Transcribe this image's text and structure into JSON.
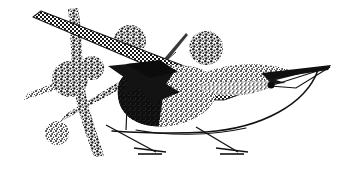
{
  "artwork": {
    "title": "Abstract halftone bird on branch",
    "medium": "high-contrast halftone / dither print illustration",
    "width": 347,
    "height": 171,
    "background_color": "#ffffff",
    "ink_color": "#1a1a1a",
    "description": "Stylized bird composed of overlapping geometric shapes filled with checkerboard, coarse dot, and solid black halftone textures, perched with two thin legs over a long sweeping curve, surrounded by dotted circular blobs and a dotted vertical branch."
  },
  "palette": {
    "solid_black": "#141414",
    "dark_gray": "#4a4a4a",
    "mid_gray": "#777777",
    "light_gray": "#a8a8a8",
    "paper_white": "#ffffff"
  },
  "elements": {
    "checkered_band": {
      "name": "checkered diagonal band",
      "texture": "checkerboard",
      "tone": "50% black",
      "note": "runs from upper-left corner down-right, widening into the wing"
    },
    "wing": {
      "name": "checkered wing",
      "texture": "checkerboard",
      "tone": "50% black"
    },
    "dark_wedge": {
      "name": "solid black wedge",
      "texture": "solid",
      "tone": "100% black"
    },
    "breast": {
      "name": "breast dome",
      "texture": "coarse dots",
      "tone": "60% black"
    },
    "belly": {
      "name": "belly dome",
      "texture": "fine dots",
      "tone": "45% black"
    },
    "head": {
      "name": "lens shaped head",
      "texture": "fine dots",
      "tone": "40% black"
    },
    "eye": {
      "name": "eye",
      "texture": "solid",
      "tone": "100% black"
    },
    "beak": {
      "name": "pointed beak",
      "texture": "solid",
      "tone": "100% black"
    },
    "legs": {
      "name": "thin legs with flat feet",
      "count": 2,
      "texture": "line",
      "tone": "100% black"
    },
    "belly_arc": {
      "name": "long sweeping curve",
      "texture": "line",
      "tone": "100% black"
    },
    "crest_line": {
      "name": "thin tapered crest stroke",
      "texture": "line",
      "tone": "80% black"
    },
    "branch_vertical": {
      "name": "dotted vertical branch",
      "texture": "coarse dots",
      "tone": "50% black"
    },
    "branch_diagonal": {
      "name": "dotted diagonal branch",
      "texture": "coarse dots",
      "tone": "50% black"
    }
  },
  "blobs": [
    {
      "name": "blob-upper-left",
      "cx": 130,
      "cy": 41,
      "r": 16,
      "tone": "coarse dots"
    },
    {
      "name": "blob-upper-right",
      "cx": 206,
      "cy": 48,
      "r": 17,
      "tone": "coarse dots"
    },
    {
      "name": "blob-mid-left",
      "cx": 70,
      "cy": 79,
      "r": 18,
      "tone": "coarse dots"
    },
    {
      "name": "blob-mid-stem",
      "cx": 92,
      "cy": 68,
      "r": 12,
      "tone": "coarse dots"
    },
    {
      "name": "blob-lower-left",
      "cx": 57,
      "cy": 133,
      "r": 12,
      "tone": "coarse dots"
    }
  ]
}
